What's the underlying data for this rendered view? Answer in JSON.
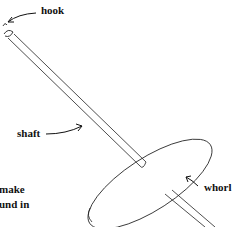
{
  "diagram": {
    "labels": {
      "hook": "hook",
      "shaft": "shaft",
      "whorl": "whorl"
    },
    "caption_fragments": [
      "make",
      "und in"
    ]
  }
}
